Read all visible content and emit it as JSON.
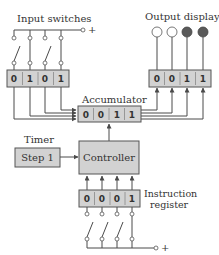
{
  "labels": {
    "input_switches": "Input switches",
    "output_display": "Output display",
    "accumulator": "Accumulator",
    "timer": "Timer",
    "step": "Step 1",
    "controller": "Controller",
    "instruction_register_line1": "Instruction",
    "instruction_register_line2": "register",
    "plus_top": "+",
    "plus_bottom": "+"
  },
  "input_register": {
    "bits": [
      "0",
      "1",
      "0",
      "1"
    ]
  },
  "input_switch_states": [
    "open",
    "closed",
    "open",
    "closed"
  ],
  "output_register": {
    "bits": [
      "0",
      "0",
      "1",
      "1"
    ]
  },
  "output_lamps": [
    "off",
    "off",
    "on",
    "on"
  ],
  "accumulator": {
    "bits": [
      "0",
      "0",
      "1",
      "1"
    ]
  },
  "instruction_register": {
    "bits": [
      "0",
      "0",
      "0",
      "1"
    ]
  },
  "instruction_switch_states": [
    "open",
    "open",
    "open",
    "closed"
  ],
  "colors": {
    "box_fill": "#d2d2d2",
    "lamp_on": "#5a5a5a",
    "lamp_off": "#ffffff",
    "wire": "#4a4a4a"
  }
}
